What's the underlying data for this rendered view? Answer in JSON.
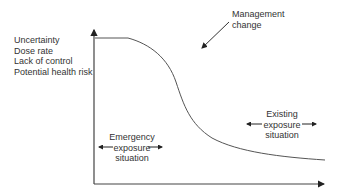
{
  "diagram": {
    "y_axis_factors": [
      "Uncertainty",
      "Dose rate",
      "Lack of control",
      "Potential health risk"
    ],
    "annotation": {
      "line1": "Management",
      "line2": "change"
    },
    "phases": {
      "emergency": {
        "line1": "Emergency",
        "line2": "exposure",
        "line3": "situation"
      },
      "existing": {
        "line1": "Existing",
        "line2": "exposure",
        "line3": "situation"
      }
    },
    "colors": {
      "axis": "#333333",
      "curve": "#444444",
      "text": "#333333"
    }
  }
}
